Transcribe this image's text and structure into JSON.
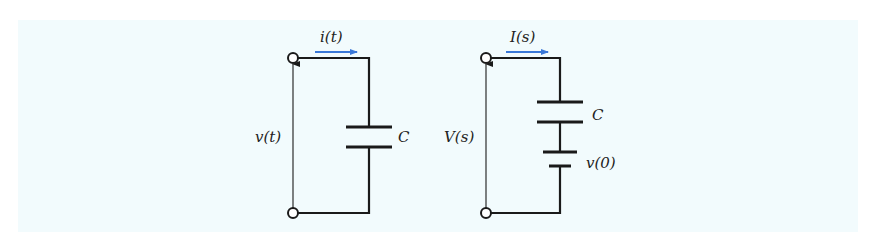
{
  "figure": {
    "background_color": "#f2fbfd",
    "wire_color": "#1a1a1a",
    "arrow_color": "#3a78d8",
    "time_domain_circuit": {
      "current_label": "i(t)",
      "voltage_label": "v(t)",
      "capacitor_label": "C"
    },
    "s_domain_circuit": {
      "current_label": "I(s)",
      "voltage_label": "V(s)",
      "capacitor_label": "C",
      "initial_voltage_label": "v(0)"
    }
  }
}
